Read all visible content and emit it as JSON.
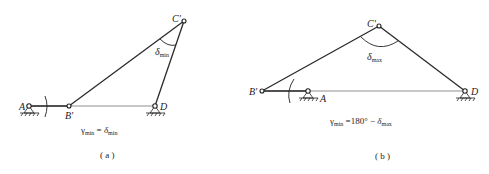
{
  "figures": [
    {
      "id": "a",
      "caption": "( a )",
      "labels": {
        "A": "A",
        "B": "B′",
        "C": "C′",
        "D": "D",
        "angle_symbol": "δ",
        "angle_sub": "min"
      },
      "formula": {
        "lhs": "γ",
        "lhs_sub": "min",
        "op": " = ",
        "rhs": "δ",
        "rhs_sub": "min"
      }
    },
    {
      "id": "b",
      "caption": "( b )",
      "labels": {
        "A": "A",
        "B": "B′",
        "C": "C′",
        "D": "D",
        "angle_symbol": "δ",
        "angle_sub": "max"
      },
      "formula": {
        "lhs": "γ",
        "lhs_sub": "min",
        "op": " =180° − ",
        "rhs": "δ",
        "rhs_sub": "max"
      }
    }
  ]
}
